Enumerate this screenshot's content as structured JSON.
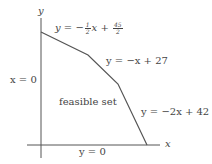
{
  "diagram": {
    "axes": {
      "x_label": "x",
      "y_label": "y"
    },
    "region_label": "feasible set",
    "constraints": [
      {
        "id": "top",
        "label_prefix": "y = −",
        "frac_num": "1",
        "frac_den": "2",
        "label_mid": "x + ",
        "frac2_num": "45",
        "frac2_den": "2"
      },
      {
        "id": "middle",
        "label": "y = −x + 27"
      },
      {
        "id": "right",
        "label": "y = −2x + 42"
      },
      {
        "id": "left",
        "label": "x = 0"
      },
      {
        "id": "bottom",
        "label": "y = 0"
      }
    ],
    "vertices": [
      {
        "x": 0,
        "y": 0
      },
      {
        "x": 0,
        "y": 22.5
      },
      {
        "x": 9,
        "y": 18
      },
      {
        "x": 15,
        "y": 12
      },
      {
        "x": 21,
        "y": 0
      }
    ],
    "colors": {
      "line": "#555555",
      "text": "#444444",
      "background": "#ffffff"
    }
  }
}
